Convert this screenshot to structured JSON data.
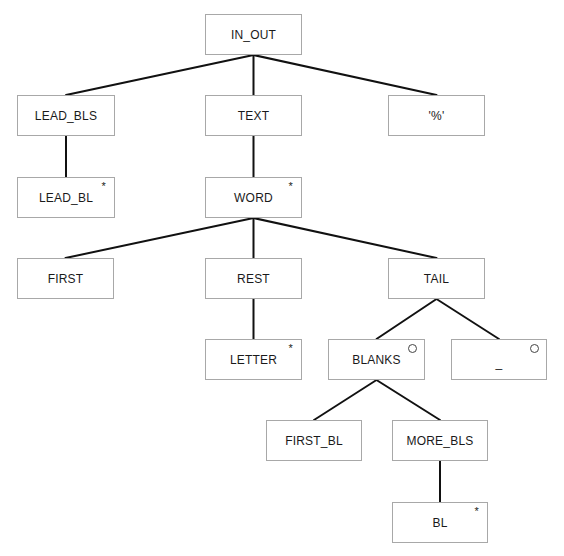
{
  "diagram": {
    "type": "jackson-structure-tree",
    "nodes": [
      {
        "id": "in_out",
        "label": "IN_OUT",
        "marker": "",
        "x": 205,
        "y": 14,
        "w": 97,
        "h": 41
      },
      {
        "id": "lead_bls",
        "label": "LEAD_BLS",
        "marker": "",
        "x": 17,
        "y": 95,
        "w": 98,
        "h": 41
      },
      {
        "id": "text",
        "label": "TEXT",
        "marker": "",
        "x": 205,
        "y": 95,
        "w": 97,
        "h": 41
      },
      {
        "id": "percent",
        "label": "'%'",
        "marker": "",
        "x": 388,
        "y": 95,
        "w": 97,
        "h": 41
      },
      {
        "id": "lead_bl",
        "label": "LEAD_BL",
        "marker": "*",
        "x": 17,
        "y": 177,
        "w": 98,
        "h": 41
      },
      {
        "id": "word",
        "label": "WORD",
        "marker": "*",
        "x": 205,
        "y": 177,
        "w": 97,
        "h": 41
      },
      {
        "id": "first",
        "label": "FIRST",
        "marker": "",
        "x": 17,
        "y": 258,
        "w": 97,
        "h": 41
      },
      {
        "id": "rest",
        "label": "REST",
        "marker": "",
        "x": 205,
        "y": 258,
        "w": 97,
        "h": 41
      },
      {
        "id": "tail",
        "label": "TAIL",
        "marker": "",
        "x": 388,
        "y": 258,
        "w": 97,
        "h": 41
      },
      {
        "id": "letter",
        "label": "LETTER",
        "marker": "*",
        "x": 205,
        "y": 339,
        "w": 97,
        "h": 41
      },
      {
        "id": "blanks",
        "label": "BLANKS",
        "marker": "o",
        "x": 328,
        "y": 339,
        "w": 97,
        "h": 41
      },
      {
        "id": "underscore",
        "label": "_",
        "marker": "o",
        "x": 451,
        "y": 339,
        "w": 96,
        "h": 41
      },
      {
        "id": "first_bl",
        "label": "FIRST_BL",
        "marker": "",
        "x": 266,
        "y": 420,
        "w": 96,
        "h": 41
      },
      {
        "id": "more_bls",
        "label": "MORE_BLS",
        "marker": "",
        "x": 392,
        "y": 420,
        "w": 96,
        "h": 41
      },
      {
        "id": "bl",
        "label": "BL",
        "marker": "*",
        "x": 392,
        "y": 502,
        "w": 96,
        "h": 41
      }
    ],
    "edges": [
      {
        "from": "in_out",
        "to": "lead_bls"
      },
      {
        "from": "in_out",
        "to": "text"
      },
      {
        "from": "in_out",
        "to": "percent"
      },
      {
        "from": "lead_bls",
        "to": "lead_bl"
      },
      {
        "from": "text",
        "to": "word"
      },
      {
        "from": "word",
        "to": "first"
      },
      {
        "from": "word",
        "to": "rest"
      },
      {
        "from": "word",
        "to": "tail"
      },
      {
        "from": "rest",
        "to": "letter"
      },
      {
        "from": "tail",
        "to": "blanks"
      },
      {
        "from": "tail",
        "to": "underscore"
      },
      {
        "from": "blanks",
        "to": "first_bl"
      },
      {
        "from": "blanks",
        "to": "more_bls"
      },
      {
        "from": "more_bls",
        "to": "bl"
      }
    ],
    "legend": {
      "iteration_marker": "*",
      "selection_marker": "o"
    },
    "colors": {
      "edge": "#111111",
      "node_border": "#a8a8a8",
      "node_fill": "#ffffff",
      "text": "#1a1a1a"
    }
  }
}
